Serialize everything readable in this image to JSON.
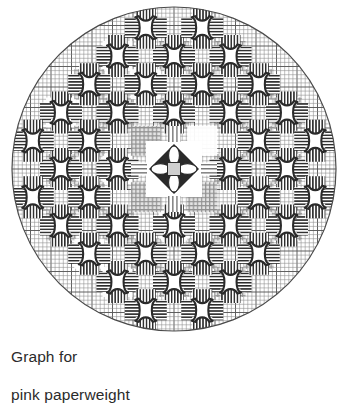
{
  "figure": {
    "title": "Graph for pink paperweight",
    "caption_lines": [
      "Graph for",
      "pink paperweight"
    ],
    "medium": "counted-thread needlework chart on graph paper",
    "shape": "circle",
    "colors": {
      "background": "#ffffff",
      "ink": "#1a1a1a",
      "grid_line": "#8c8c8c",
      "grid_line_major": "#595959",
      "circle_outline": "#4a4a4a",
      "motif_dark": "#2a2a2a",
      "motif_mid": "#6e6e6e",
      "block_light": "#d8d8d8",
      "block_white": "#ffffff",
      "caption_text": "#2b2b2b"
    },
    "canvas": {
      "width": 342,
      "height": 363
    }
  },
  "circle": {
    "cx": 174,
    "cy": 169,
    "r": 162,
    "stroke_width": 1.2,
    "label": "circular design boundary"
  },
  "grid": {
    "cell": 4.1,
    "major_every": 5,
    "minor_width": 0.55,
    "major_width": 0.95,
    "description": "fine graph-paper grid filling the circle"
  },
  "lattice": {
    "description": "cross motifs on a staggered (diagonal) lattice centred on the quatrefoil",
    "spacing": 56.5,
    "half_spacing": 28.25,
    "rows": 7,
    "cols": 7,
    "motif_size": 40,
    "arm_thickness": 13,
    "max_radius": 150
  },
  "motif": {
    "name": "cross-with-star-centre",
    "arms": [
      {
        "position": "top",
        "hatch": "vertical"
      },
      {
        "position": "bottom",
        "hatch": "vertical"
      },
      {
        "position": "left",
        "hatch": "horizontal"
      },
      {
        "position": "right",
        "hatch": "horizontal"
      }
    ],
    "centre": "white four-point star / hourglass",
    "count_visible": 36
  },
  "filler_blocks": {
    "description": "shaded square blocks between the cross motifs",
    "size": 30,
    "tones": [
      "#d8d8d8",
      "#ffffff",
      "#c4c4c4"
    ],
    "hatch_tones": [
      "#7a7a7a",
      "#9a9a9a"
    ]
  },
  "centre_motif": {
    "name": "quatrefoil",
    "cx": 174,
    "cy": 169,
    "plaque_size": 56,
    "plaque_fill": "#ffffff",
    "petals": 4,
    "petal_fill": "#ffffff",
    "diamond_fill": "#2a2a2a",
    "core_fill": "#cfcfcf",
    "core_size": 13
  },
  "chart_data": {
    "type": "heatmap",
    "title": "Graph for pink paperweight",
    "xlabel": "",
    "ylabel": "",
    "grid": true,
    "legend": "none",
    "categories": [
      "cross-motif",
      "filler-block",
      "quatrefoil-centre",
      "graph-grid",
      "circle-outline"
    ],
    "values": [
      36,
      49,
      1,
      1,
      1
    ],
    "symmetry": "4-fold radial (and diagonal mirror)"
  }
}
